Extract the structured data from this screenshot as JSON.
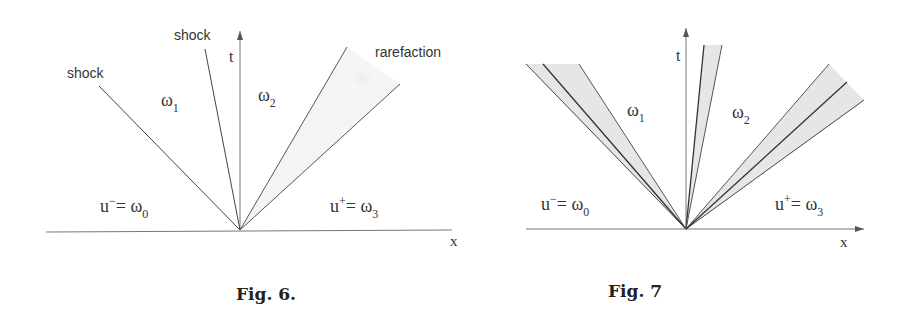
{
  "figures": [
    {
      "id": "fig6",
      "caption": "Fig. 6.",
      "axes": {
        "t_label": "t",
        "x_label": "x"
      },
      "wave_labels": {
        "left_shock": "shock",
        "middle_shock": "shock",
        "rarefaction": "rarefaction"
      },
      "regions": {
        "omega1": {
          "base": "ω",
          "sub": "1"
        },
        "omega2": {
          "base": "ω",
          "sub": "2"
        },
        "left_state": {
          "u": "u",
          "sup": "−",
          "eq": "= ω",
          "sub": "0"
        },
        "right_state": {
          "u": "u",
          "sup": "+",
          "eq": "= ω",
          "sub": "3"
        }
      }
    },
    {
      "id": "fig7",
      "caption": "Fig. 7",
      "axes": {
        "t_label": "t",
        "x_label": "x"
      },
      "regions": {
        "omega1": {
          "base": "ω",
          "sub": "1"
        },
        "omega2": {
          "base": "ω",
          "sub": "2"
        },
        "left_state": {
          "u": "u",
          "sup": "−",
          "eq": "= ω",
          "sub": "0"
        },
        "right_state": {
          "u": "u",
          "sup": "+",
          "eq": "= ω",
          "sub": "3"
        }
      }
    }
  ],
  "colors": {
    "line": "#444444",
    "axis": "#666666",
    "fan_fill": "#e6e6e6",
    "text": "#222222"
  }
}
